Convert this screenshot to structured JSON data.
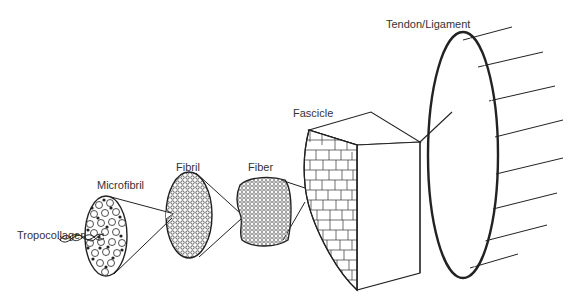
{
  "diagram": {
    "labels": {
      "tropocollagen": "Tropocollagen",
      "microfibril": "Microfibril",
      "fibril": "Fibril",
      "fiber": "Fiber",
      "fascicle": "Fascicle",
      "tendon_ligament": "Tendon/Ligament"
    },
    "levels": [
      "Tropocollagen",
      "Microfibril",
      "Fibril",
      "Fiber",
      "Fascicle",
      "Tendon/Ligament"
    ],
    "colors": {
      "line": "#222222",
      "text": "#333333",
      "background": "#ffffff"
    }
  }
}
